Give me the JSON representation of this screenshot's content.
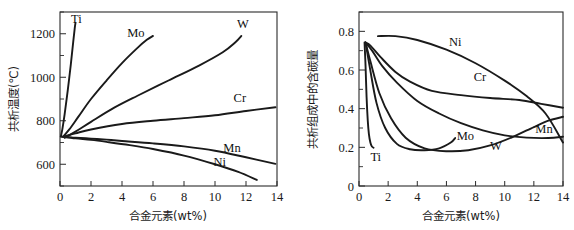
{
  "figure": {
    "background": "#ffffff",
    "curve_color": "#1a1a1a",
    "axis_color": "#2a2a2a"
  },
  "chart_data": [
    {
      "type": "line",
      "title": "",
      "panel": "left",
      "xlabel": "合金元素(wt%)",
      "ylabel": "共析温度(℃)",
      "xlim": [
        0,
        14
      ],
      "ylim": [
        500,
        1300
      ],
      "xticks": [
        0,
        2,
        4,
        6,
        8,
        10,
        12,
        14
      ],
      "xticklabels": [
        "0",
        "2",
        "4",
        "6",
        "8",
        "10",
        "12",
        "14"
      ],
      "yticks": [
        600,
        800,
        1000,
        1200
      ],
      "yticklabels": [
        "600",
        "800",
        "1000",
        "1200"
      ],
      "yminorticks": [
        500,
        700,
        900,
        1100,
        1300
      ],
      "grid": false,
      "legend_position": "inline-curve-labels",
      "series": [
        {
          "name": "Ti",
          "label": "Ti",
          "label_x": 1.05,
          "label_y": 1272,
          "x": [
            0.05,
            0.15,
            0.3,
            0.5,
            0.7,
            0.85,
            0.95,
            1.0
          ],
          "y": [
            727,
            760,
            830,
            940,
            1060,
            1160,
            1225,
            1250
          ]
        },
        {
          "name": "Mo",
          "label": "Mo",
          "label_x": 4.9,
          "label_y": 1208,
          "x": [
            0.2,
            0.6,
            1.2,
            2.0,
            3.0,
            4.0,
            5.0,
            5.6,
            6.0
          ],
          "y": [
            727,
            760,
            820,
            900,
            985,
            1065,
            1135,
            1172,
            1190
          ]
        },
        {
          "name": "W",
          "label": "W",
          "label_x": 11.8,
          "label_y": 1248,
          "x": [
            0.3,
            1.0,
            2.0,
            3.5,
            5.0,
            7.0,
            9.0,
            10.5,
            11.3,
            11.7
          ],
          "y": [
            722,
            750,
            795,
            860,
            915,
            985,
            1055,
            1115,
            1160,
            1190
          ]
        },
        {
          "name": "Cr",
          "label": "Cr",
          "label_x": 11.6,
          "label_y": 905,
          "x": [
            0.2,
            1.0,
            2.0,
            4.0,
            6.0,
            8.0,
            10.0,
            12.0,
            13.9
          ],
          "y": [
            727,
            742,
            760,
            785,
            800,
            812,
            825,
            845,
            862
          ]
        },
        {
          "name": "Mn",
          "label": "Mn",
          "label_x": 11.1,
          "label_y": 676,
          "x": [
            0.1,
            1.0,
            2.0,
            3.0,
            4.0,
            6.0,
            8.0,
            10.0,
            12.0,
            13.9
          ],
          "y": [
            727,
            722,
            718,
            713,
            707,
            696,
            682,
            662,
            632,
            602
          ]
        },
        {
          "name": "Ni",
          "label": "Ni",
          "label_x": 10.3,
          "label_y": 613,
          "x": [
            0.1,
            1.0,
            2.0,
            3.0,
            4.5,
            6.0,
            8.0,
            10.0,
            11.5,
            12.7
          ],
          "y": [
            727,
            719,
            712,
            703,
            688,
            670,
            640,
            600,
            565,
            528
          ]
        }
      ]
    },
    {
      "type": "line",
      "title": "",
      "panel": "right",
      "xlabel": "合金元素(wt%)",
      "ylabel": "共析组成中的含碳量",
      "xlim": [
        0,
        14
      ],
      "ylim": [
        0,
        0.9
      ],
      "xticks": [
        0,
        2,
        4,
        6,
        8,
        10,
        12,
        14
      ],
      "xticklabels": [
        "0",
        "2",
        "4",
        "6",
        "8",
        "10",
        "12",
        "14"
      ],
      "yticks": [
        0,
        0.2,
        0.4,
        0.6,
        0.8
      ],
      "yticklabels": [
        "0",
        "0.2",
        "0.4",
        "0.6",
        "0.8"
      ],
      "yminorticks": [
        0.1,
        0.3,
        0.5,
        0.7,
        0.9
      ],
      "grid": false,
      "legend_position": "inline-curve-labels",
      "series": [
        {
          "name": "Ni",
          "label": "Ni",
          "label_x": 6.6,
          "label_y": 0.745,
          "x": [
            1.3,
            2.5,
            4.0,
            6.0,
            8.0,
            10.0,
            11.5,
            12.8,
            14.0
          ],
          "y": [
            0.775,
            0.775,
            0.755,
            0.705,
            0.635,
            0.545,
            0.465,
            0.375,
            0.225
          ]
        },
        {
          "name": "Cr",
          "label": "Cr",
          "label_x": 8.3,
          "label_y": 0.565,
          "x": [
            0.45,
            0.8,
            1.5,
            2.5,
            3.5,
            5.0,
            7.0,
            9.0,
            11.0,
            12.5,
            14.0
          ],
          "y": [
            0.742,
            0.725,
            0.665,
            0.59,
            0.54,
            0.492,
            0.47,
            0.455,
            0.445,
            0.425,
            0.405
          ]
        },
        {
          "name": "Mn",
          "label": "Mn",
          "label_x": 12.7,
          "label_y": 0.3,
          "x": [
            0.45,
            0.9,
            1.6,
            2.6,
            4.0,
            5.5,
            7.0,
            8.5,
            10.0,
            11.5,
            13.0,
            14.0
          ],
          "y": [
            0.742,
            0.7,
            0.62,
            0.535,
            0.44,
            0.375,
            0.325,
            0.288,
            0.262,
            0.25,
            0.248,
            0.255
          ]
        },
        {
          "name": "W",
          "label": "W",
          "label_x": 9.4,
          "label_y": 0.212,
          "x": [
            0.45,
            0.8,
            1.4,
            2.2,
            3.2,
            4.5,
            6.0,
            7.5,
            9.0,
            10.5,
            12.0,
            13.0,
            14.0
          ],
          "y": [
            0.742,
            0.64,
            0.48,
            0.35,
            0.25,
            0.195,
            0.18,
            0.185,
            0.21,
            0.252,
            0.305,
            0.338,
            0.358
          ]
        },
        {
          "name": "Mo",
          "label": "Mo",
          "label_x": 7.3,
          "label_y": 0.26,
          "x": [
            0.45,
            0.75,
            1.2,
            1.8,
            2.6,
            3.5,
            4.5,
            5.5,
            6.3,
            6.6
          ],
          "y": [
            0.742,
            0.61,
            0.43,
            0.3,
            0.218,
            0.19,
            0.185,
            0.195,
            0.225,
            0.248
          ]
        },
        {
          "name": "Ti",
          "label": "Ti",
          "label_x": 1.15,
          "label_y": 0.152,
          "x": [
            0.38,
            0.45,
            0.52,
            0.6,
            0.68,
            0.78,
            0.88,
            1.0
          ],
          "y": [
            0.742,
            0.62,
            0.46,
            0.34,
            0.268,
            0.225,
            0.205,
            0.198
          ]
        }
      ]
    }
  ]
}
